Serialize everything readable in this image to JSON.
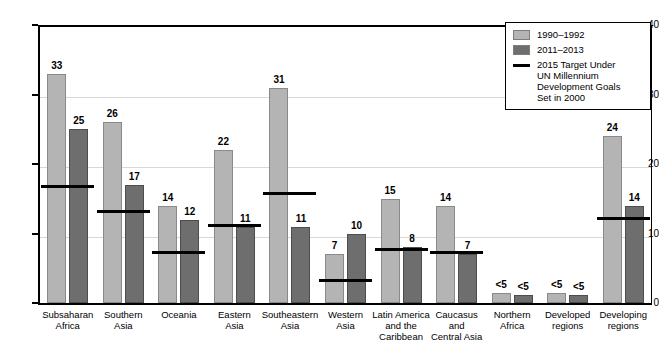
{
  "chart_data": {
    "type": "bar",
    "title": "",
    "subtitle": "",
    "xlabel": "",
    "ylabel": "",
    "ylim": [
      0,
      40
    ],
    "yticks": [
      0,
      10,
      20,
      30,
      40
    ],
    "grid": true,
    "legend_position": "top-right",
    "categories": [
      "Subsaharan Africa",
      "Southern Asia",
      "Oceania",
      "Eastern Asia",
      "Southeastern Asia",
      "Western Asia",
      "Latin America and the Caribbean",
      "Caucasus and Central Asia",
      "Northern Africa",
      "Developed regions",
      "Developing regions"
    ],
    "category_lines": [
      [
        "Subsaharan",
        "Africa"
      ],
      [
        "Southern",
        "Asia"
      ],
      [
        "Oceania"
      ],
      [
        "Eastern",
        "Asia"
      ],
      [
        "Southeastern",
        "Asia"
      ],
      [
        "Western",
        "Asia"
      ],
      [
        "Latin America",
        "and the",
        "Caribbean"
      ],
      [
        "Caucasus",
        "and",
        "Central Asia"
      ],
      [
        "Northern",
        "Africa"
      ],
      [
        "Developed",
        "regions"
      ],
      [
        "Developing",
        "regions"
      ]
    ],
    "series": [
      {
        "name": "1990–1992",
        "color": "#b4b4b4",
        "values": [
          33,
          26,
          14,
          22,
          31,
          7,
          15,
          14,
          1.5,
          1.5,
          24
        ],
        "labels": [
          "33",
          "26",
          "14",
          "22",
          "31",
          "7",
          "15",
          "14",
          "<5",
          "<5",
          "24"
        ]
      },
      {
        "name": "2011–2013",
        "color": "#6e6e6e",
        "values": [
          25,
          17,
          12,
          11,
          11,
          10,
          8,
          7,
          1.2,
          1.2,
          14
        ],
        "labels": [
          "25",
          "17",
          "12",
          "11",
          "11",
          "10",
          "8",
          "7",
          "<5",
          "<5",
          "14"
        ]
      }
    ],
    "target_line": {
      "name": "2015 Target Under UN Millennium Development Goals Set in 2000",
      "color": "#000000",
      "values": [
        16.5,
        13,
        7,
        11,
        15.5,
        3,
        7.5,
        7,
        null,
        null,
        12
      ]
    }
  },
  "legend": {
    "items": [
      {
        "label": "1990–1992",
        "type": "swatch",
        "color": "#b4b4b4"
      },
      {
        "label": "2011–2013",
        "type": "swatch",
        "color": "#6e6e6e"
      },
      {
        "label": "2015 Target Under",
        "label2": "UN Millennium Development Goals",
        "label3": "Set in 2000",
        "type": "line",
        "color": "#000000"
      }
    ]
  }
}
